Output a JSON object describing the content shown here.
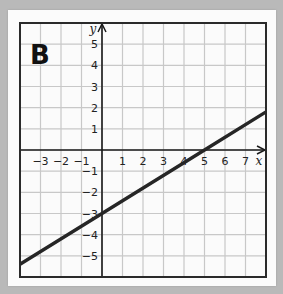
{
  "panel": {
    "label": "B"
  },
  "chart_data": {
    "type": "line",
    "title": "B",
    "xlabel": "x",
    "ylabel": "y",
    "xlim": [
      -4,
      8
    ],
    "ylim": [
      -6,
      6
    ],
    "grid": true,
    "x_ticks": [
      -3,
      -2,
      -1,
      1,
      2,
      3,
      4,
      5,
      6,
      7
    ],
    "y_ticks": [
      5,
      4,
      3,
      2,
      1,
      -1,
      -2,
      -3,
      -4,
      -5
    ],
    "series": [
      {
        "name": "line",
        "equation": "y = (3/5)x - 3",
        "x": [
          -4,
          0,
          5,
          8
        ],
        "y": [
          -5.4,
          -3,
          0,
          1.8
        ]
      }
    ]
  },
  "colors": {
    "background": "#b9b9b9",
    "panel": "#fbfbfb",
    "grid": "#c8c8c8",
    "line": "#262626"
  }
}
